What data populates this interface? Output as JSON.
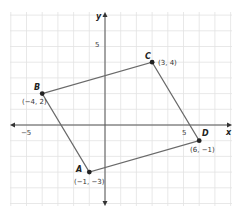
{
  "diagram": {
    "type": "coordinate-plane-quadrilateral",
    "axes": {
      "x_label": "x",
      "y_label": "y",
      "x_tick_labels": [
        {
          "value": -5,
          "text": "−5"
        },
        {
          "value": 5,
          "text": "5"
        }
      ],
      "y_tick_labels": [
        {
          "value": 5,
          "text": "5"
        }
      ],
      "x_range": [
        -6,
        8
      ],
      "y_range": [
        -5,
        7
      ]
    },
    "grid": true,
    "points": [
      {
        "name": "A",
        "x": -1,
        "y": -3,
        "coord_label": "(−1, −3)"
      },
      {
        "name": "B",
        "x": -4,
        "y": 2,
        "coord_label": "(−4, 2)"
      },
      {
        "name": "C",
        "x": 3,
        "y": 4,
        "coord_label": "(3, 4)"
      },
      {
        "name": "D",
        "x": 6,
        "y": -1,
        "coord_label": "(6, −1)"
      }
    ],
    "polygon_order": [
      "A",
      "B",
      "C",
      "D"
    ],
    "colors": {
      "grid": "#e2e2e2",
      "axis": "#555555",
      "edge": "#6a6a6a",
      "point": "#222222"
    }
  }
}
